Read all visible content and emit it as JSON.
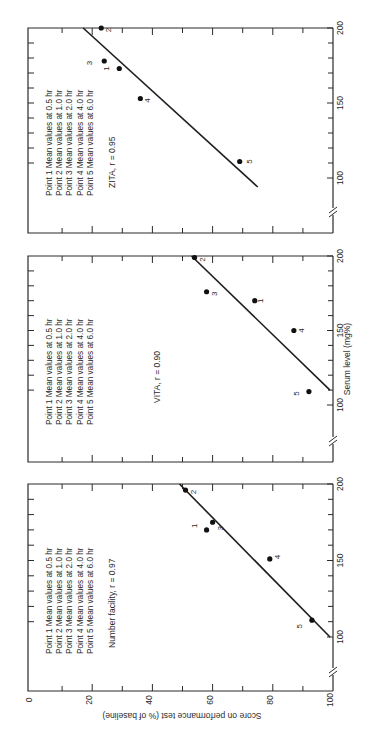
{
  "figure": {
    "ylabel": "Score on performance test (% of baseline)",
    "xlabel": "Serum level (mg%)",
    "orientation": "rotated 90° counter-clockwise"
  },
  "legend_lines": [
    "Point  1  Mean  values  at  0.5  hr",
    "Point  2  Mean  values  at  1.0  hr",
    "Point  3  Mean  values  at  2.0  hr",
    "Point  4  Mean  values  at  4.0  hr",
    "Point  5  Mean  values  at  6.0  hr"
  ],
  "score_ticks": [
    "0",
    "20",
    "40",
    "60",
    "80",
    "100"
  ],
  "serum_ticks": [
    "100",
    "150",
    "200"
  ],
  "chart_data": [
    {
      "type": "scatter",
      "title": "ZITA, r = 0.95",
      "xlabel": "Serum level (mg%)",
      "ylabel": "Score on performance test (% of baseline)",
      "xlim": [
        75,
        200
      ],
      "ylim": [
        0,
        100
      ],
      "points": [
        {
          "label": "1",
          "serum": 173,
          "score": 29
        },
        {
          "label": "2",
          "serum": 200,
          "score": 23
        },
        {
          "label": "3",
          "serum": 178,
          "score": 24
        },
        {
          "label": "4",
          "serum": 153,
          "score": 36
        },
        {
          "label": "5",
          "serum": 111,
          "score": 69
        }
      ],
      "fit_line": {
        "from": {
          "serum": 200,
          "score": 17
        },
        "to": {
          "serum": 94,
          "score": 75
        }
      },
      "r": 0.95
    },
    {
      "type": "scatter",
      "title": "VITA, r = 0.90",
      "xlabel": "Serum level (mg%)",
      "ylabel": "Score on performance test (% of baseline)",
      "xlim": [
        75,
        200
      ],
      "ylim": [
        0,
        100
      ],
      "points": [
        {
          "label": "1",
          "serum": 170,
          "score": 74
        },
        {
          "label": "2",
          "serum": 199,
          "score": 54
        },
        {
          "label": "3",
          "serum": 176,
          "score": 58
        },
        {
          "label": "4",
          "serum": 150,
          "score": 87
        },
        {
          "label": "5",
          "serum": 109,
          "score": 92
        }
      ],
      "fit_line": {
        "from": {
          "serum": 200,
          "score": 53
        },
        "to": {
          "serum": 110,
          "score": 99
        }
      },
      "r": 0.9
    },
    {
      "type": "scatter",
      "title": "Number facility, r = 0.97",
      "xlabel": "Serum level (mg%)",
      "ylabel": "Score on performance test (% of baseline)",
      "xlim": [
        75,
        200
      ],
      "ylim": [
        0,
        100
      ],
      "points": [
        {
          "label": "1",
          "serum": 170,
          "score": 58
        },
        {
          "label": "2",
          "serum": 196,
          "score": 51
        },
        {
          "label": "3",
          "serum": 175,
          "score": 60
        },
        {
          "label": "4",
          "serum": 151,
          "score": 79
        },
        {
          "label": "5",
          "serum": 111,
          "score": 93
        }
      ],
      "fit_line": {
        "from": {
          "serum": 200,
          "score": 49
        },
        "to": {
          "serum": 100,
          "score": 99
        }
      },
      "r": 0.97
    }
  ],
  "panels_layout": [
    {
      "top": 28,
      "bottom": 233,
      "y200": 28,
      "y100": 178,
      "break_y": 212
    },
    {
      "top": 256,
      "bottom": 462,
      "y200": 256,
      "y100": 405,
      "break_y": 441
    },
    {
      "top": 484,
      "bottom": 691,
      "y200": 484,
      "y100": 637,
      "break_y": 672
    }
  ],
  "label_offsets": {
    "0": [
      [
        -10,
        0
      ],
      [
        10,
        2
      ],
      [
        -12,
        2
      ],
      [
        10,
        2
      ],
      [
        12,
        0
      ]
    ],
    "1": [
      [
        8,
        0
      ],
      [
        10,
        2
      ],
      [
        10,
        2
      ],
      [
        10,
        0
      ],
      [
        -10,
        2
      ]
    ],
    "2": [
      [
        -10,
        -4
      ],
      [
        10,
        2
      ],
      [
        10,
        6
      ],
      [
        10,
        -2
      ],
      [
        -10,
        6
      ]
    ]
  }
}
